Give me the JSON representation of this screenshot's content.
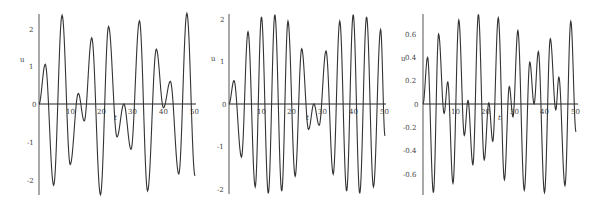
{
  "chart_data": [
    {
      "type": "line",
      "title": "",
      "xlabel": "t",
      "ylabel": "u",
      "xlim": [
        0,
        50
      ],
      "ylim": [
        -2.4,
        2.4
      ],
      "x_ticks": [
        10,
        20,
        30,
        40,
        50
      ],
      "y_ticks": [
        -2,
        -1,
        0,
        1,
        2
      ],
      "grid": false,
      "legend": null,
      "series": [
        {
          "name": "u(t)",
          "color": "#333333",
          "extrema_t": [
            0,
            2.0,
            4.7,
            7.4,
            10.0,
            12.6,
            14.5,
            16.9,
            19.7,
            22.3,
            25.0,
            27.2,
            29.5,
            32.2,
            34.8,
            37.6,
            39.9,
            42.1,
            44.8,
            47.4,
            50.0
          ],
          "extrema_u": [
            0,
            1.05,
            -2.15,
            2.35,
            -1.6,
            0.28,
            -0.45,
            1.75,
            -2.4,
            2.05,
            -0.87,
            0.0,
            -1.2,
            2.2,
            -2.3,
            1.45,
            -0.1,
            0.6,
            -1.85,
            2.4,
            -1.9
          ]
        }
      ]
    },
    {
      "type": "line",
      "title": "",
      "xlabel": "t",
      "ylabel": "u",
      "xlim": [
        0,
        50
      ],
      "ylim": [
        -2.1,
        2.1
      ],
      "x_ticks": [
        10,
        20,
        30,
        40,
        50
      ],
      "y_ticks": [
        -2,
        -1,
        0,
        1,
        2
      ],
      "grid": false,
      "legend": null,
      "series": [
        {
          "name": "u(t)",
          "color": "#333333",
          "extrema_t": [
            0,
            1.6,
            4.0,
            6.1,
            8.4,
            10.4,
            12.6,
            14.7,
            16.9,
            18.9,
            21.2,
            23.3,
            25.5,
            27.2,
            28.9,
            31.1,
            33.4,
            35.5,
            37.7,
            39.8,
            41.9,
            44.1,
            46.3,
            48.6,
            50.0
          ],
          "extrema_u": [
            0,
            0.55,
            -1.25,
            1.7,
            -1.95,
            2.05,
            -2.1,
            2.1,
            -2.05,
            1.95,
            -1.7,
            1.3,
            -0.6,
            0.0,
            -0.5,
            1.25,
            -1.65,
            1.95,
            -2.05,
            2.1,
            -2.1,
            2.05,
            -1.95,
            1.75,
            -0.75
          ]
        }
      ]
    },
    {
      "type": "line",
      "title": "",
      "xlabel": "t",
      "ylabel": "u",
      "xlim": [
        0,
        50
      ],
      "ylim": [
        -0.78,
        0.78
      ],
      "x_ticks": [
        10,
        20,
        30,
        40,
        50
      ],
      "y_ticks": [
        -0.6,
        -0.4,
        -0.2,
        0,
        0.2,
        0.4,
        0.6
      ],
      "grid": false,
      "legend": null,
      "series": [
        {
          "name": "u(t)",
          "color": "#333333",
          "extrema_t": [
            0,
            1.5,
            3.4,
            5.1,
            6.9,
            8.1,
            9.8,
            11.7,
            13.5,
            14.7,
            16.3,
            18.1,
            20.0,
            21.5,
            22.8,
            24.6,
            26.6,
            28.2,
            29.4,
            31.0,
            33.1,
            34.9,
            36.3,
            37.7,
            39.7,
            41.6,
            43.4,
            44.4,
            46.4,
            48.3,
            50.0
          ],
          "extrema_u": [
            0,
            0.4,
            -0.76,
            0.6,
            -0.08,
            0.19,
            -0.68,
            0.72,
            -0.27,
            0.03,
            -0.52,
            0.77,
            -0.48,
            0.01,
            -0.32,
            0.74,
            -0.65,
            0.15,
            -0.11,
            0.63,
            -0.74,
            0.36,
            0.0,
            0.45,
            -0.76,
            0.56,
            -0.05,
            0.23,
            -0.7,
            0.71,
            -0.24
          ]
        }
      ]
    }
  ],
  "panels": [
    {
      "ylabel": "u",
      "xlabel": "t",
      "ytick_labels": [
        "2",
        "1",
        "0",
        "-1",
        "-2"
      ],
      "xtick_labels": [
        "10",
        "20",
        "30",
        "40",
        "50"
      ]
    },
    {
      "ylabel": "u",
      "xlabel": "t",
      "ytick_labels": [
        "2",
        "1",
        "0",
        "-1",
        "-2"
      ],
      "xtick_labels": [
        "10",
        "20",
        "30",
        "40",
        "50"
      ]
    },
    {
      "ylabel": "u",
      "xlabel": "t",
      "ytick_labels": [
        "0.6",
        "0.4",
        "0.2",
        "0",
        "-0.2",
        "-0.4",
        "-0.6"
      ],
      "xtick_labels": [
        "10",
        "20",
        "30",
        "40",
        "50"
      ]
    }
  ]
}
